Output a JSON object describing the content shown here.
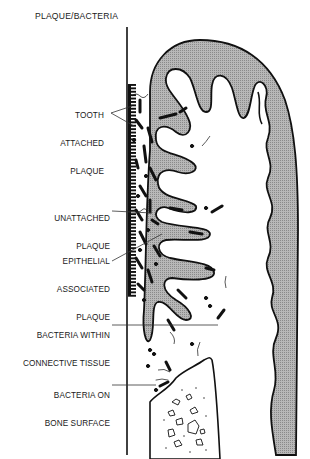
{
  "figure": {
    "title": "PLAQUE/BACTERIA",
    "labels": [
      {
        "id": "tooth-attached-plaque",
        "lines": [
          "TOOTH",
          "ATTACHED",
          "PLAQUE"
        ]
      },
      {
        "id": "unattached-plaque",
        "lines": [
          "UNATTACHED",
          "PLAQUE"
        ]
      },
      {
        "id": "epithelial-associated-plaque",
        "lines": [
          "EPITHELIAL",
          "ASSOCIATED",
          "PLAQUE"
        ]
      },
      {
        "id": "bacteria-within-connective-tissue",
        "lines": [
          "BACTERIA WITHIN",
          "CONNECTIVE TISSUE"
        ]
      },
      {
        "id": "bacteria-on-bone-surface",
        "lines": [
          "BACTERIA ON",
          "BONE SURFACE"
        ]
      }
    ],
    "colors": {
      "ink": "#111111",
      "epithelium_fill": "#a9a9a9",
      "background": "#ffffff"
    }
  }
}
